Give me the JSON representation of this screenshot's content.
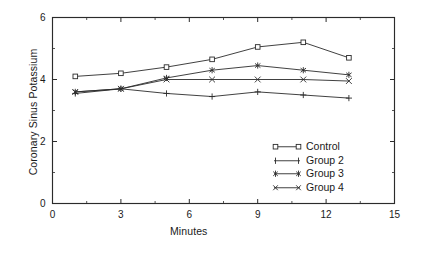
{
  "chart_data": {
    "type": "line",
    "title": "",
    "xlabel": "Minutes",
    "ylabel": "Coronary Sinus Potassium",
    "x": [
      1,
      3,
      5,
      7,
      9,
      11,
      13
    ],
    "xlim": [
      0,
      15
    ],
    "ylim": [
      0,
      6
    ],
    "xticks": [
      0,
      3,
      6,
      9,
      12,
      15
    ],
    "yticks": [
      0,
      2,
      4,
      6
    ],
    "xticklabels": [
      "0",
      "3",
      "6",
      "9",
      "12",
      "15"
    ],
    "yticklabels": [
      "0",
      "2",
      "4",
      "6"
    ],
    "minor_xticks": [
      1.5,
      4.5,
      7.5,
      10.5,
      13.5
    ],
    "minor_yticks": [
      1,
      3,
      5
    ],
    "grid": false,
    "legend_position": "center-right-inside",
    "series": [
      {
        "name": "Control",
        "marker": "open-square",
        "values": [
          4.1,
          4.2,
          4.4,
          4.65,
          5.05,
          5.2,
          4.7
        ]
      },
      {
        "name": "Group 2",
        "marker": "plus",
        "values": [
          3.55,
          3.7,
          3.55,
          3.45,
          3.6,
          3.5,
          3.4
        ]
      },
      {
        "name": "Group 3",
        "marker": "asterisk",
        "values": [
          3.6,
          3.7,
          4.05,
          4.3,
          4.45,
          4.3,
          4.15
        ]
      },
      {
        "name": "Group 4",
        "marker": "cross",
        "values": [
          3.6,
          3.7,
          4.0,
          4.0,
          4.0,
          4.0,
          3.95
        ]
      }
    ],
    "colors": {
      "axis": "#2b2b2b",
      "line": "#2b2b2b",
      "background": "#ffffff"
    }
  },
  "legend": {
    "entries": [
      {
        "label": "Control"
      },
      {
        "label": "Group 2"
      },
      {
        "label": "Group 3"
      },
      {
        "label": "Group 4"
      }
    ]
  },
  "axes": {
    "x_title": "Minutes",
    "y_title": "Coronary Sinus Potassium"
  }
}
